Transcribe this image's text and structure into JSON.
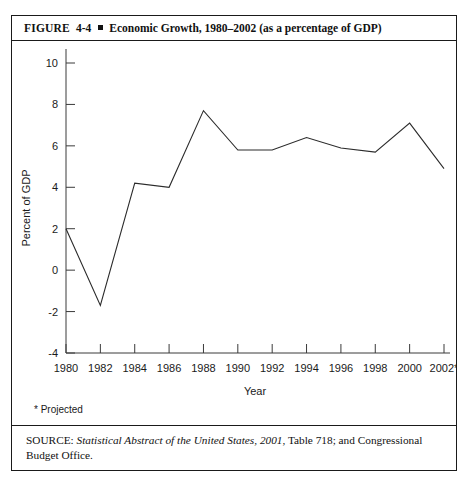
{
  "figure": {
    "label": "FIGURE",
    "number": "4-4",
    "bullet_icon": "square-bullet",
    "title": "Economic Growth, 1980–2002 (as a percentage of GDP)"
  },
  "footnote": "* Projected",
  "source": {
    "label": "SOURCE:",
    "italic_title": "Statistical Abstract of the United States, 2001",
    "rest": ", Table 718; and Congressional Budget Office."
  },
  "chart_data": {
    "type": "line",
    "title": "Economic Growth, 1980–2002 (as a percentage of GDP)",
    "xlabel": "Year",
    "ylabel": "Percent of GDP",
    "x": [
      1980,
      1982,
      1984,
      1986,
      1988,
      1990,
      1992,
      1994,
      1996,
      1998,
      2000,
      2002
    ],
    "categories": [
      "1980",
      "1982",
      "1984",
      "1986",
      "1988",
      "1990",
      "1992",
      "1994",
      "1996",
      "1998",
      "2000",
      "2002*"
    ],
    "values": [
      2.0,
      -1.7,
      4.2,
      4.0,
      7.7,
      5.8,
      5.8,
      6.4,
      5.9,
      5.7,
      7.1,
      4.9
    ],
    "series": [
      {
        "name": "Economic Growth",
        "values": [
          2.0,
          -1.7,
          4.2,
          4.0,
          7.7,
          5.8,
          5.8,
          6.4,
          5.9,
          5.7,
          7.1,
          4.9
        ]
      }
    ],
    "ylim": [
      -4,
      10
    ],
    "yticks": [
      -4,
      -2,
      0,
      2,
      4,
      6,
      8,
      10
    ],
    "ytick_labels": [
      "-4",
      "-2",
      "0",
      "2",
      "4",
      "6",
      "8",
      "10"
    ],
    "xlim": [
      1980,
      2002
    ],
    "xticks": [
      1980,
      1982,
      1984,
      1986,
      1988,
      1990,
      1992,
      1994,
      1996,
      1998,
      2000,
      2002
    ],
    "xtick_labels": [
      "1980",
      "1982",
      "1984",
      "1986",
      "1988",
      "1990",
      "1992",
      "1994",
      "1996",
      "1998",
      "2000",
      "2002*"
    ],
    "grid": false,
    "legend": false,
    "line_color": "#2b2b2b",
    "spines": [
      "left",
      "bottom"
    ]
  }
}
